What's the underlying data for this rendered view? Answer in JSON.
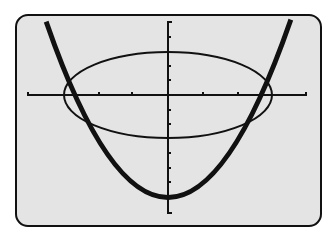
{
  "calculator_screen": {
    "type": "graph",
    "background": "#e4e4e4",
    "frame_color": "#111111",
    "graphs": [
      {
        "name": "parabola",
        "style": "thick",
        "description": "upward-opening parabola, vertex below x-axis"
      },
      {
        "name": "ellipse",
        "style": "thin",
        "description": "ellipse centered at origin, wider than tall"
      }
    ],
    "axes": {
      "x_ticks_each_side": 4,
      "y_ticks_each_side": 4
    }
  }
}
